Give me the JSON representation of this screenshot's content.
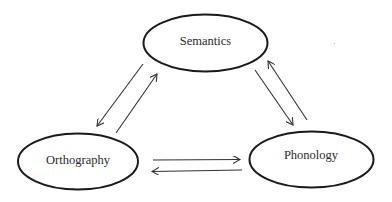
{
  "diagram": {
    "type": "triangle-of-bidirectional-connections",
    "nodes": [
      {
        "id": "semantics",
        "label": "Semantics"
      },
      {
        "id": "orthography",
        "label": "Orthography"
      },
      {
        "id": "phonology",
        "label": "Phonology"
      }
    ],
    "edges": [
      {
        "from": "orthography",
        "to": "semantics"
      },
      {
        "from": "semantics",
        "to": "orthography"
      },
      {
        "from": "semantics",
        "to": "phonology"
      },
      {
        "from": "phonology",
        "to": "semantics"
      },
      {
        "from": "orthography",
        "to": "phonology"
      },
      {
        "from": "phonology",
        "to": "orthography"
      }
    ],
    "colors": {
      "stroke": "#1a1a1a",
      "arrow": "#333333",
      "text": "#2a2a2a",
      "background": "#ffffff"
    }
  }
}
